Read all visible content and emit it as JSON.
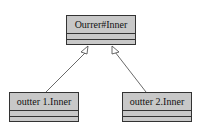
{
  "diagram": {
    "type": "uml-class-inheritance",
    "parent": {
      "name": "Ourrer#Inner"
    },
    "children": [
      {
        "name": "outter 1.Inner"
      },
      {
        "name": "outter 2.Inner"
      }
    ],
    "relations": [
      {
        "from": "outter 1.Inner",
        "to": "Ourrer#Inner",
        "kind": "generalization"
      },
      {
        "from": "outter 2.Inner",
        "to": "Ourrer#Inner",
        "kind": "generalization"
      }
    ]
  }
}
